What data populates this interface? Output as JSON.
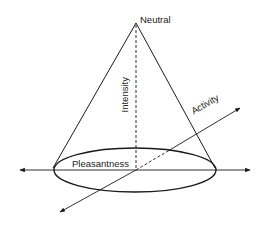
{
  "diagram": {
    "labels": {
      "apex": "Neutral",
      "vertical_axis": "Intensity",
      "diagonal_axis": "Activity",
      "horizontal_axis": "Pleasantness"
    },
    "colors": {
      "stroke": "#1a1a1a",
      "background": "#ffffff"
    },
    "geometry": {
      "apex": [
        136,
        23
      ],
      "ellipse_center": [
        135,
        170
      ],
      "ellipse_rx": 81,
      "ellipse_ry": 22,
      "horizontal_axis": [
        [
          20,
          170
        ],
        [
          250,
          170
        ]
      ],
      "activity_axis": [
        [
          60,
          212
        ],
        [
          240,
          108
        ]
      ]
    }
  }
}
